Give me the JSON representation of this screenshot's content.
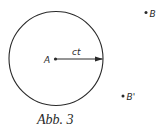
{
  "figure": {
    "caption": "Abb. 3",
    "colors": {
      "ink": "#2a2a2a",
      "background": "#ffffff"
    },
    "circle": {
      "center": [
        56,
        58.5
      ],
      "radius": 47,
      "radius_label": "ct"
    },
    "points": [
      {
        "id": "A",
        "label": "A",
        "position": [
          55,
          59
        ]
      },
      {
        "id": "B",
        "label": "B",
        "position": [
          146,
          12.5
        ]
      },
      {
        "id": "B_prime",
        "label": "B'",
        "position": [
          123,
          96
        ]
      }
    ]
  }
}
